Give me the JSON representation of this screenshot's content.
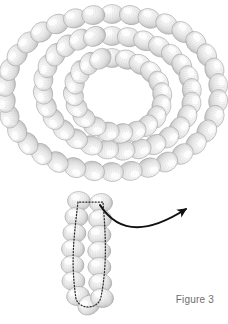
{
  "figure": {
    "caption": "Figure 3",
    "caption_color": "#6e6e6e",
    "background_color": "#ffffff",
    "canvas": {
      "width": 228,
      "height": 324
    }
  },
  "chart_data": {
    "type": "diagram",
    "title": "Figure 3",
    "bead_style": {
      "fill_light": "#ffffff",
      "fill_mid": "#e3e3e3",
      "fill_dark": "#b9b9b9",
      "edge": "#9a9a9a",
      "stripe_color": "#cfcfcf",
      "radius_x": 11.5,
      "radius_y": 9.5
    },
    "annotation_style": {
      "dotted_color": "#2b2b2b",
      "dotted_width": 1.2,
      "dotted_dash": "1.2 2.0",
      "arrow_color": "#111111",
      "arrow_width": 2.0
    },
    "spiral": {
      "center": [
        112,
        103
      ],
      "turns": 2,
      "outer_radius": 96,
      "inner_radius": 44,
      "bead_count": 76
    },
    "tail": {
      "bead_count": 14,
      "start": [
        88,
        196
      ],
      "end": [
        84,
        310
      ]
    },
    "dotted_loop": {
      "shape": "hairpin",
      "top_left": [
        78,
        202
      ],
      "top_right": [
        103,
        202
      ],
      "bottom": [
        85,
        305
      ]
    },
    "arrow": {
      "start": [
        100,
        205
      ],
      "control1": [
        120,
        236
      ],
      "control2": [
        150,
        232
      ],
      "tip": [
        186,
        209
      ]
    },
    "outer_ring_beads": [
      {
        "cx": 112.0,
        "cy": 14.0,
        "rot": 0
      },
      {
        "cx": 130.8,
        "cy": 15.1,
        "rot": 12
      },
      {
        "cx": 149.2,
        "cy": 18.4,
        "rot": 24
      },
      {
        "cx": 166.6,
        "cy": 24.0,
        "rot": 35
      },
      {
        "cx": 182.4,
        "cy": 32.0,
        "rot": 46
      },
      {
        "cx": 196.0,
        "cy": 42.4,
        "rot": 57
      },
      {
        "cx": 206.8,
        "cy": 55.0,
        "rot": 68
      },
      {
        "cx": 214.4,
        "cy": 69.4,
        "rot": 78
      },
      {
        "cx": 218.2,
        "cy": 85.0,
        "rot": 88
      },
      {
        "cx": 218.2,
        "cy": 101.0,
        "rot": 98
      },
      {
        "cx": 214.4,
        "cy": 116.6,
        "rot": 108
      },
      {
        "cx": 206.8,
        "cy": 131.0,
        "rot": 118
      },
      {
        "cx": 196.0,
        "cy": 143.6,
        "rot": 129
      },
      {
        "cx": 182.4,
        "cy": 154.0,
        "rot": 140
      },
      {
        "cx": 166.6,
        "cy": 162.0,
        "rot": 151
      },
      {
        "cx": 149.2,
        "cy": 167.6,
        "rot": 162
      },
      {
        "cx": 130.8,
        "cy": 170.9,
        "rot": 174
      },
      {
        "cx": 112.0,
        "cy": 172.0,
        "rot": 186
      },
      {
        "cx": 93.2,
        "cy": 170.9,
        "rot": 198
      },
      {
        "cx": 74.8,
        "cy": 167.6,
        "rot": 210
      },
      {
        "cx": 57.4,
        "cy": 162.0,
        "rot": 221
      },
      {
        "cx": 41.6,
        "cy": 154.0,
        "rot": 232
      },
      {
        "cx": 28.0,
        "cy": 143.6,
        "rot": 243
      },
      {
        "cx": 17.2,
        "cy": 131.0,
        "rot": 254
      },
      {
        "cx": 9.6,
        "cy": 116.6,
        "rot": 264
      },
      {
        "cx": 5.8,
        "cy": 101.0,
        "rot": 274
      },
      {
        "cx": 5.8,
        "cy": 85.0,
        "rot": 284
      },
      {
        "cx": 9.6,
        "cy": 69.4,
        "rot": 294
      },
      {
        "cx": 17.2,
        "cy": 55.0,
        "rot": 304
      },
      {
        "cx": 28.0,
        "cy": 42.4,
        "rot": 315
      },
      {
        "cx": 41.6,
        "cy": 32.0,
        "rot": 326
      },
      {
        "cx": 57.4,
        "cy": 24.0,
        "rot": 337
      },
      {
        "cx": 74.8,
        "cy": 18.4,
        "rot": 348
      },
      {
        "cx": 93.2,
        "cy": 15.1,
        "rot": 356
      }
    ],
    "middle_ring_beads": [
      {
        "cx": 112.0,
        "cy": 36.0,
        "rot": 0
      },
      {
        "cx": 128.6,
        "cy": 37.2,
        "rot": 13
      },
      {
        "cx": 144.6,
        "cy": 40.8,
        "rot": 26
      },
      {
        "cx": 159.2,
        "cy": 46.8,
        "rot": 38
      },
      {
        "cx": 171.8,
        "cy": 55.0,
        "rot": 50
      },
      {
        "cx": 181.8,
        "cy": 65.2,
        "rot": 62
      },
      {
        "cx": 188.6,
        "cy": 77.0,
        "rot": 74
      },
      {
        "cx": 191.8,
        "cy": 90.0,
        "rot": 86
      },
      {
        "cx": 191.4,
        "cy": 103.4,
        "rot": 98
      },
      {
        "cx": 187.2,
        "cy": 116.2,
        "rot": 110
      },
      {
        "cx": 179.4,
        "cy": 127.8,
        "rot": 122
      },
      {
        "cx": 168.4,
        "cy": 137.4,
        "rot": 134
      },
      {
        "cx": 155.0,
        "cy": 144.6,
        "rot": 146
      },
      {
        "cx": 139.8,
        "cy": 149.0,
        "rot": 158
      },
      {
        "cx": 123.6,
        "cy": 150.6,
        "rot": 170
      },
      {
        "cx": 107.2,
        "cy": 149.4,
        "rot": 182
      },
      {
        "cx": 91.2,
        "cy": 145.4,
        "rot": 194
      },
      {
        "cx": 76.4,
        "cy": 138.8,
        "rot": 206
      },
      {
        "cx": 63.6,
        "cy": 129.8,
        "rot": 218
      },
      {
        "cx": 53.4,
        "cy": 118.8,
        "rot": 230
      },
      {
        "cx": 46.4,
        "cy": 106.2,
        "rot": 242
      },
      {
        "cx": 43.0,
        "cy": 92.8,
        "rot": 254
      },
      {
        "cx": 43.4,
        "cy": 79.2,
        "rot": 266
      },
      {
        "cx": 47.6,
        "cy": 66.2,
        "rot": 278
      },
      {
        "cx": 55.4,
        "cy": 54.8,
        "rot": 290
      },
      {
        "cx": 66.4,
        "cy": 45.8,
        "rot": 302
      },
      {
        "cx": 79.6,
        "cy": 39.6,
        "rot": 314
      },
      {
        "cx": 94.4,
        "cy": 36.4,
        "rot": 330
      }
    ],
    "inner_ring_beads": [
      {
        "cx": 112.0,
        "cy": 58.0,
        "rot": 0
      },
      {
        "cx": 126.6,
        "cy": 59.6,
        "rot": 16
      },
      {
        "cx": 140.0,
        "cy": 64.4,
        "rot": 32
      },
      {
        "cx": 151.0,
        "cy": 72.2,
        "rot": 48
      },
      {
        "cx": 158.6,
        "cy": 82.4,
        "rot": 64
      },
      {
        "cx": 162.2,
        "cy": 94.0,
        "rot": 80
      },
      {
        "cx": 161.4,
        "cy": 106.0,
        "rot": 96
      },
      {
        "cx": 156.2,
        "cy": 117.0,
        "rot": 112
      },
      {
        "cx": 147.2,
        "cy": 125.8,
        "rot": 128
      },
      {
        "cx": 135.2,
        "cy": 131.4,
        "rot": 144
      },
      {
        "cx": 121.6,
        "cy": 133.4,
        "rot": 160
      },
      {
        "cx": 107.8,
        "cy": 131.6,
        "rot": 176
      },
      {
        "cx": 94.8,
        "cy": 126.2,
        "rot": 192
      },
      {
        "cx": 84.0,
        "cy": 117.6,
        "rot": 208
      },
      {
        "cx": 76.6,
        "cy": 106.8,
        "rot": 224
      },
      {
        "cx": 73.4,
        "cy": 94.8,
        "rot": 240
      },
      {
        "cx": 74.6,
        "cy": 82.8,
        "rot": 256
      },
      {
        "cx": 80.2,
        "cy": 72.0,
        "rot": 272
      },
      {
        "cx": 89.4,
        "cy": 63.6,
        "rot": 292
      },
      {
        "cx": 100.4,
        "cy": 58.8,
        "rot": 320
      }
    ],
    "tail_beads_left": [
      {
        "cx": 79.0,
        "cy": 201.0,
        "rot": 4
      },
      {
        "cx": 76.4,
        "cy": 217.0,
        "rot": 4
      },
      {
        "cx": 74.4,
        "cy": 233.0,
        "rot": 3
      },
      {
        "cx": 73.0,
        "cy": 249.0,
        "rot": 2
      },
      {
        "cx": 72.4,
        "cy": 265.0,
        "rot": 1
      },
      {
        "cx": 73.4,
        "cy": 281.0,
        "rot": 0
      },
      {
        "cx": 78.0,
        "cy": 296.0,
        "rot": 350
      },
      {
        "cx": 89.0,
        "cy": 305.0,
        "rot": 330
      }
    ],
    "tail_beads_right": [
      {
        "cx": 101.0,
        "cy": 203.0,
        "rot": 356
      },
      {
        "cx": 100.0,
        "cy": 219.0,
        "rot": 357
      },
      {
        "cx": 99.4,
        "cy": 235.0,
        "rot": 358
      },
      {
        "cx": 99.2,
        "cy": 251.0,
        "rot": 359
      },
      {
        "cx": 99.4,
        "cy": 267.0,
        "rot": 0
      },
      {
        "cx": 100.2,
        "cy": 283.0,
        "rot": 2
      },
      {
        "cx": 102.0,
        "cy": 298.0,
        "rot": 6
      }
    ]
  }
}
